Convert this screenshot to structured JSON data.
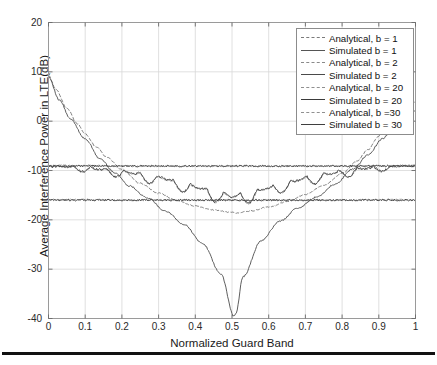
{
  "chart_data": {
    "type": "line",
    "title": "",
    "xlabel": "Normalized Guard Band",
    "ylabel": "Average Interference Power in LTE(dB)",
    "xlim": [
      0,
      1
    ],
    "ylim": [
      -40,
      20
    ],
    "xticks": [
      "0",
      "0.1",
      "0.2",
      "0.3",
      "0.4",
      "0.5",
      "0.6",
      "0.7",
      "0.8",
      "0.9",
      "1"
    ],
    "yticks": [
      "20",
      "10",
      "0",
      "-10",
      "-20",
      "-30",
      "-40"
    ],
    "grid": true,
    "legend_position": "top-right",
    "series": [
      {
        "name": "Analytical, b = 1",
        "style": "dashed",
        "color": "#7a7a7a",
        "x": [
          0,
          0.02,
          0.05,
          0.08,
          0.1,
          0.13,
          0.16,
          0.2,
          0.25,
          0.3,
          0.35,
          0.4,
          0.45,
          0.5,
          0.51,
          0.55,
          0.6,
          0.65,
          0.7,
          0.75,
          0.8,
          0.84,
          0.87,
          0.9,
          0.92,
          0.95,
          0.98,
          1
        ],
        "values": [
          9.3,
          6.5,
          2.6,
          -0.6,
          -2.6,
          -5.2,
          -7.4,
          -9.8,
          -12.6,
          -14.6,
          -16.1,
          -17.2,
          -18.0,
          -18.5,
          -18.6,
          -18.2,
          -17.4,
          -16.3,
          -14.9,
          -13.0,
          -10.6,
          -8.1,
          -5.8,
          -3.0,
          -1.0,
          1.5,
          3.2,
          3.8
        ]
      },
      {
        "name": "Simulated b = 1",
        "style": "solid",
        "color": "#555555",
        "x": [
          0,
          0.03,
          0.06,
          0.1,
          0.14,
          0.18,
          0.22,
          0.27,
          0.32,
          0.37,
          0.42,
          0.47,
          0.505,
          0.51,
          0.53,
          0.58,
          0.63,
          0.68,
          0.73,
          0.78,
          0.83,
          0.87,
          0.91,
          0.94,
          0.97,
          1
        ],
        "values": [
          9.0,
          4.2,
          0.4,
          -3.6,
          -7.6,
          -10.4,
          -13.1,
          -15.6,
          -18.3,
          -21.0,
          -24.8,
          -31.0,
          -39.5,
          -39.2,
          -31.5,
          -24.2,
          -20.3,
          -17.6,
          -15.4,
          -12.8,
          -9.7,
          -6.9,
          -3.6,
          -1.2,
          0.9,
          2.1
        ]
      },
      {
        "name": "Analytical, b = 2",
        "style": "dashed",
        "color": "#8a8a8a",
        "x": [
          0,
          0.05,
          0.1,
          0.15,
          0.2,
          0.25,
          0.3,
          0.35,
          0.4,
          0.45,
          0.5,
          0.55,
          0.6,
          0.65,
          0.7,
          0.75,
          0.8,
          0.85,
          0.9,
          0.95,
          1
        ],
        "values": [
          -8.9,
          -9.1,
          -9.3,
          -9.6,
          -10.0,
          -10.5,
          -11.2,
          -12.0,
          -13.0,
          -14.0,
          -14.8,
          -14.2,
          -13.2,
          -12.2,
          -11.3,
          -10.6,
          -10.0,
          -9.5,
          -9.2,
          -9.0,
          -8.9
        ]
      },
      {
        "name": "Simulated b = 2",
        "style": "solid",
        "color": "#4a4a4a",
        "x": [
          0,
          0.05,
          0.1,
          0.15,
          0.2,
          0.25,
          0.3,
          0.35,
          0.4,
          0.45,
          0.5,
          0.55,
          0.6,
          0.65,
          0.7,
          0.75,
          0.8,
          0.85,
          0.9,
          0.95,
          1
        ],
        "values": [
          -9.0,
          -9.1,
          -9.2,
          -9.5,
          -9.9,
          -10.4,
          -11.0,
          -11.9,
          -12.9,
          -13.9,
          -14.7,
          -14.1,
          -13.1,
          -12.1,
          -11.2,
          -10.5,
          -9.9,
          -9.4,
          -9.1,
          -9.0,
          -8.9
        ]
      },
      {
        "name": "Analytical, b = 20",
        "style": "dashed",
        "color": "#8f8f8f",
        "x": [
          0,
          0.1,
          0.2,
          0.3,
          0.4,
          0.5,
          0.6,
          0.7,
          0.8,
          0.9,
          1
        ],
        "values": [
          -15.9,
          -15.9,
          -16.0,
          -16.0,
          -16.0,
          -16.0,
          -16.0,
          -16.0,
          -16.0,
          -15.9,
          -15.9
        ]
      },
      {
        "name": "Simulated b = 20",
        "style": "solid",
        "color": "#3a3a3a",
        "x": [
          0,
          0.1,
          0.2,
          0.3,
          0.4,
          0.5,
          0.6,
          0.7,
          0.8,
          0.9,
          1
        ],
        "values": [
          -16.0,
          -16.0,
          -16.0,
          -16.0,
          -16.0,
          -16.0,
          -16.0,
          -16.0,
          -16.0,
          -16.0,
          -16.0
        ]
      },
      {
        "name": "Analytical, b =30",
        "style": "dashed",
        "color": "#909090",
        "x": [
          0,
          0.1,
          0.2,
          0.3,
          0.4,
          0.5,
          0.6,
          0.7,
          0.8,
          0.9,
          1
        ],
        "values": [
          -9.0,
          -9.0,
          -9.1,
          -9.1,
          -9.1,
          -9.1,
          -9.1,
          -9.1,
          -9.1,
          -9.0,
          -9.0
        ]
      },
      {
        "name": "Simulated b = 30",
        "style": "solid",
        "color": "#3f3f3f",
        "x": [
          0,
          0.1,
          0.2,
          0.3,
          0.4,
          0.5,
          0.6,
          0.7,
          0.8,
          0.9,
          1
        ],
        "values": [
          -9.1,
          -9.1,
          -9.1,
          -9.1,
          -9.1,
          -9.1,
          -9.1,
          -9.1,
          -9.1,
          -9.1,
          -9.1
        ]
      }
    ],
    "annotations": {
      "minimum": {
        "x": 0.51,
        "y": -39.5,
        "series": "Simulated b = 1"
      },
      "start_peak": {
        "x": 0,
        "y": 9.3,
        "series": "Analytical, b = 1"
      }
    }
  },
  "legend": {
    "entries": [
      {
        "label": "Analytical, b = 1",
        "style": "dashed"
      },
      {
        "label": "Simulated b = 1",
        "style": "solid"
      },
      {
        "label": "Analytical, b = 2",
        "style": "dashed"
      },
      {
        "label": "Simulated b = 2",
        "style": "solid"
      },
      {
        "label": "Analytical, b = 20",
        "style": "dashed"
      },
      {
        "label": "Simulated b = 20",
        "style": "solid"
      },
      {
        "label": "Analytical, b =30",
        "style": "dashed"
      },
      {
        "label": "Simulated b = 30",
        "style": "solid"
      }
    ]
  },
  "colors": {
    "axis": "#9a9a9a",
    "grid": "#d8d8d8",
    "text": "#1a1a1a",
    "rule": "#111111"
  }
}
